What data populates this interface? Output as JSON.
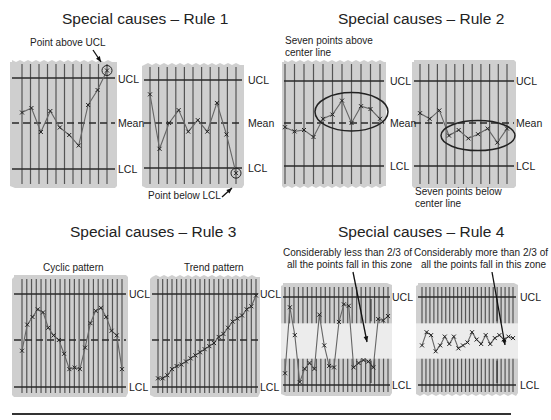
{
  "titles": {
    "rule1": "Special causes – Rule 1",
    "rule2": "Special causes – Rule 2",
    "rule3": "Special causes – Rule 3",
    "rule4": "Special causes – Rule 4"
  },
  "notes": {
    "rule1_above": "Point above UCL",
    "rule1_below": "Point below LCL",
    "rule2_above_l1": "Seven points above",
    "rule2_above_l2": "center line",
    "rule2_below_l1": "Seven points below",
    "rule2_below_l2": "center line",
    "rule3_cyclic": "Cyclic pattern",
    "rule3_trend": "Trend pattern",
    "rule4_less_l1": "Considerably less than 2/3 of",
    "rule4_less_l2": "all the points fall in this zone",
    "rule4_more_l1": "Considerably more than 2/3 of",
    "rule4_more_l2": "all the points fall in this zone"
  },
  "line_labels": {
    "ucl": "UCL",
    "mean": "Mean",
    "lcl": "LCL"
  },
  "colors": {
    "panel_fill": "#cfcfcf",
    "zone_fill": "#ececec",
    "line": "#2a2a2a",
    "grid": "#555555",
    "data": "#666666"
  },
  "chart_data": [
    {
      "id": "rule1-a",
      "type": "line",
      "title": "Special causes – Rule 1",
      "annotation": "Point above UCL",
      "scale": {
        "ucl": 3,
        "mean": 0,
        "lcl": -3
      },
      "x": [
        1,
        2,
        3,
        4,
        5,
        6,
        7,
        8,
        9,
        10,
        11
      ],
      "values": [
        0.7,
        1.0,
        -0.6,
        0.8,
        -0.3,
        -0.8,
        -1.5,
        1.2,
        2.2,
        3.5
      ],
      "highlight_index": 9
    },
    {
      "id": "rule1-b",
      "type": "line",
      "annotation": "Point below LCL",
      "scale": {
        "ucl": 3,
        "mean": 0,
        "lcl": -3
      },
      "values": [
        2.0,
        -1.8,
        0.0,
        0.9,
        -0.6,
        0.2,
        -0.6,
        1.4,
        -0.8,
        -3.5
      ],
      "highlight_index": 9
    },
    {
      "id": "rule2-a",
      "type": "line",
      "title": "Special causes – Rule 2",
      "annotation": "Seven points above center line",
      "scale": {
        "ucl": 3,
        "mean": 0,
        "lcl": -3
      },
      "values": [
        -0.3,
        -0.6,
        -0.5,
        -1.0,
        0.3,
        0.6,
        1.6,
        0.0,
        1.2,
        1.0,
        0.3
      ],
      "ellipse_range": [
        4,
        10
      ]
    },
    {
      "id": "rule2-b",
      "type": "line",
      "annotation": "Seven points below center line",
      "scale": {
        "ucl": 3,
        "mean": 0,
        "lcl": -3
      },
      "values": [
        0.7,
        0.3,
        0.9,
        -0.9,
        -0.5,
        -1.1,
        -0.8,
        -0.4,
        -1.4,
        -0.4
      ],
      "ellipse_range": [
        3,
        9
      ]
    },
    {
      "id": "rule3-a",
      "type": "line",
      "title": "Special causes – Rule 3",
      "annotation": "Cyclic pattern",
      "scale": {
        "ucl": 3,
        "mean": 0,
        "lcl": -3
      },
      "values": [
        -0.7,
        1.0,
        1.5,
        2.0,
        1.8,
        0.8,
        0.3,
        0.0,
        -0.9,
        -1.9,
        -1.8,
        -1.9,
        -0.5,
        1.1,
        1.9,
        2.1,
        1.5,
        0.6,
        0.3,
        -1.9
      ]
    },
    {
      "id": "rule3-b",
      "type": "line",
      "annotation": "Trend pattern",
      "scale": {
        "ucl": 3,
        "mean": 0,
        "lcl": -3
      },
      "values": [
        -2.5,
        -2.5,
        -2.3,
        -1.9,
        -1.7,
        -1.6,
        -1.4,
        -1.2,
        -1.0,
        -0.8,
        -0.6,
        -0.4,
        -0.2,
        0.2,
        0.4,
        0.8,
        1.2,
        1.4,
        1.6,
        2.0,
        2.2,
        2.9
      ]
    },
    {
      "id": "rule4-a",
      "type": "line",
      "title": "Special causes – Rule 4",
      "annotation": "Considerably less than 2/3 of all the points fall in this zone",
      "scale": {
        "ucl": 3,
        "mean": 0,
        "lcl": -3
      },
      "zone": [
        -1,
        1
      ],
      "values": [
        -2.2,
        2.3,
        0.4,
        -2.8,
        -1.9,
        -1.5,
        -1.9,
        1.8,
        -0.3,
        -1.7,
        -1.8,
        1.3,
        2.5,
        2.4,
        -1.8,
        -1.5,
        -1.3,
        -1.4,
        -1.8,
        1.5,
        1.4,
        1.7
      ]
    },
    {
      "id": "rule4-b",
      "type": "line",
      "annotation": "Considerably more than 2/3 of all the points fall in this zone",
      "scale": {
        "ucl": 3,
        "mean": 0,
        "lcl": -3
      },
      "zone": [
        -1,
        1
      ],
      "values": [
        -0.3,
        0.6,
        0.4,
        -0.7,
        -0.3,
        0.3,
        -0.2,
        0.3,
        -0.5,
        -0.3,
        -0.1,
        0.6,
        0.1,
        -0.2,
        0.4,
        -0.2,
        0.2,
        0.4,
        0.1,
        0.3,
        0.2
      ]
    }
  ]
}
